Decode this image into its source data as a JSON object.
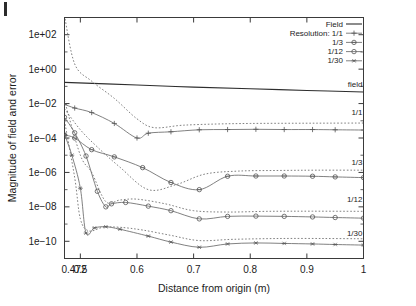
{
  "figure": {
    "artifact": "scan-mark"
  },
  "chart_data": {
    "type": "line",
    "title": "",
    "xlabel": "Distance from origin (m)",
    "ylabel": "Magnitude of field and error",
    "xlim": [
      0.472,
      1.0
    ],
    "ylim": [
      1e-11,
      1000.0
    ],
    "yscale": "log",
    "xscale": "linear",
    "grid": false,
    "xticks": [
      0.472,
      0.5,
      0.6,
      0.7,
      0.8,
      0.9,
      1
    ],
    "xticklabels": [
      "0.472",
      "0.5",
      "0.6",
      "0.7",
      "0.8",
      "0.9",
      "1"
    ],
    "yticks": [
      100.0,
      1.0,
      0.01,
      0.0001,
      1e-06,
      1e-08,
      1e-10
    ],
    "yticklabels": [
      "1e+02",
      "1e+00",
      "1e-02",
      "1e-04",
      "1e-06",
      "1e-08",
      "1e-10"
    ],
    "legend": {
      "position": "top-right",
      "entries": [
        {
          "label": "Field",
          "style": "solid",
          "marker": "none"
        },
        {
          "label": "Resolution: 1/1",
          "style": "solid",
          "marker": "plus"
        },
        {
          "label": "1/3",
          "style": "solid",
          "marker": "cross-circle"
        },
        {
          "label": "1/12",
          "style": "solid",
          "marker": "circle"
        },
        {
          "label": "1/30",
          "style": "solid",
          "marker": "star"
        }
      ]
    },
    "annotations": [
      {
        "text": "field",
        "x": 1.0,
        "y": 0.045
      },
      {
        "text": "1/1",
        "x": 1.0,
        "y": 0.0011
      },
      {
        "text": "1/3",
        "x": 1.0,
        "y": 1.4e-06
      },
      {
        "text": "1/12",
        "x": 1.0,
        "y": 1e-08
      },
      {
        "text": "1/30",
        "x": 1.0,
        "y": 1e-10
      }
    ],
    "series": [
      {
        "name": "Field",
        "style": "solid",
        "marker": "none",
        "x": [
          0.472,
          0.6,
          0.7,
          0.8,
          0.9,
          1.0
        ],
        "values": [
          0.17,
          0.12,
          0.09,
          0.072,
          0.058,
          0.047
        ]
      },
      {
        "name": "1/1 error",
        "style": "solid",
        "marker": "plus",
        "x": [
          0.472,
          0.49,
          0.52,
          0.56,
          0.6,
          0.62,
          0.66,
          0.71,
          0.76,
          0.81,
          0.86,
          0.91,
          0.95,
          1.0
        ],
        "values": [
          0.009,
          0.0055,
          0.003,
          0.0007,
          0.0001,
          0.00019,
          0.00023,
          0.0003,
          0.00031,
          0.00032,
          0.00031,
          0.00031,
          0.0003,
          0.00029
        ]
      },
      {
        "name": "1/1 bound",
        "style": "dashed",
        "marker": "none",
        "x": [
          0.472,
          0.49,
          0.52,
          0.56,
          0.6,
          0.63,
          0.68,
          0.74,
          0.8,
          0.88,
          0.94,
          1.0
        ],
        "values": [
          1300.0,
          2.0,
          0.2,
          0.02,
          0.0013,
          0.0004,
          0.00055,
          0.00065,
          0.0007,
          0.00072,
          0.00073,
          0.00074
        ]
      },
      {
        "name": "1/3 error",
        "style": "solid",
        "marker": "cross-circle",
        "x": [
          0.472,
          0.49,
          0.52,
          0.56,
          0.61,
          0.66,
          0.71,
          0.76,
          0.81,
          0.86,
          0.91,
          0.95,
          1.0
        ],
        "values": [
          0.00015,
          0.0001,
          2.1e-05,
          8e-06,
          1.9e-06,
          2.6e-07,
          1e-07,
          6e-07,
          6.2e-07,
          6.2e-07,
          6e-07,
          5.5e-07,
          5e-07
        ]
      },
      {
        "name": "1/3 bound",
        "style": "dashed",
        "marker": "none",
        "x": [
          0.472,
          0.5,
          0.53,
          0.57,
          0.62,
          0.67,
          0.72,
          0.78,
          0.85,
          0.92,
          1.0
        ],
        "values": [
          0.005,
          0.0003,
          3e-05,
          2e-06,
          1e-07,
          2e-07,
          8e-07,
          1.2e-06,
          1.3e-06,
          1.35e-06,
          1.35e-06
        ]
      },
      {
        "name": "1/12 error",
        "style": "solid",
        "marker": "circle",
        "x": [
          0.472,
          0.49,
          0.51,
          0.53,
          0.545,
          0.555,
          0.58,
          0.62,
          0.66,
          0.71,
          0.76,
          0.81,
          0.86,
          0.91,
          0.95,
          1.0
        ],
        "values": [
          0.0016,
          0.0002,
          9e-06,
          8e-08,
          1e-08,
          1.5e-08,
          1.8e-08,
          1.1e-08,
          6e-09,
          2e-09,
          2.8e-09,
          2.9e-09,
          2.8e-09,
          2.6e-09,
          2.4e-09,
          2.2e-09
        ]
      },
      {
        "name": "1/12 bound",
        "style": "dashed",
        "marker": "none",
        "x": [
          0.472,
          0.5,
          0.52,
          0.545,
          0.57,
          0.6,
          0.65,
          0.7,
          0.76,
          0.83,
          0.91,
          1.0
        ],
        "values": [
          0.015,
          1e-05,
          1e-06,
          2e-08,
          2.5e-08,
          2.8e-08,
          1.5e-08,
          6e-09,
          5e-09,
          5.5e-09,
          5.6e-09,
          5.5e-09
        ]
      },
      {
        "name": "1/30 error",
        "style": "solid",
        "marker": "star",
        "x": [
          0.472,
          0.485,
          0.5,
          0.51,
          0.525,
          0.545,
          0.57,
          0.62,
          0.66,
          0.71,
          0.76,
          0.81,
          0.86,
          0.91,
          0.95,
          1.0
        ],
        "values": [
          0.00016,
          1e-05,
          1.2e-07,
          3e-10,
          6e-10,
          7e-10,
          5e-10,
          2e-10,
          9e-11,
          4.5e-11,
          7e-11,
          8e-11,
          7.5e-11,
          7e-11,
          6.5e-11,
          6e-11
        ]
      },
      {
        "name": "1/30 bound",
        "style": "dashed",
        "marker": "none",
        "x": [
          0.472,
          0.49,
          0.5,
          0.515,
          0.54,
          0.57,
          0.61,
          0.66,
          0.71,
          0.77,
          0.85,
          0.93,
          1.0
        ],
        "values": [
          0.001,
          5e-07,
          2e-09,
          4e-10,
          6.5e-10,
          6.5e-10,
          4.5e-10,
          2.2e-10,
          1.1e-10,
          1.3e-10,
          1.45e-10,
          1.45e-10,
          1.4e-10
        ]
      }
    ]
  }
}
